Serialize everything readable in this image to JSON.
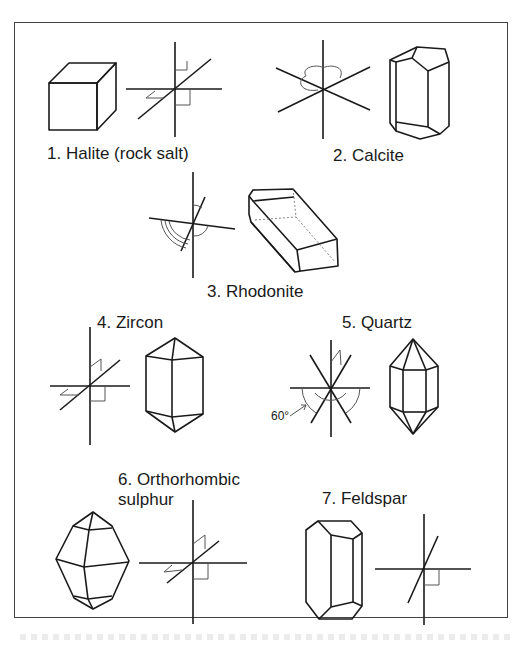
{
  "figure": {
    "minerals": [
      {
        "number": 1,
        "label": "1. Halite (rock salt)",
        "crystal_shape": "cube",
        "axes": "isometric-cubic"
      },
      {
        "number": 2,
        "label": "2. Calcite",
        "crystal_shape": "hexagonal-prism-rhombohedral",
        "axes": "trigonal"
      },
      {
        "number": 3,
        "label": "3. Rhodonite",
        "crystal_shape": "tabular-triclinic",
        "axes": "triclinic"
      },
      {
        "number": 4,
        "label": "4. Zircon",
        "crystal_shape": "tetragonal-bipyramid-prism",
        "axes": "tetragonal"
      },
      {
        "number": 5,
        "label": "5. Quartz",
        "crystal_shape": "hexagonal-prism-bipyramid",
        "axes": "hexagonal",
        "angle_label": "60°"
      },
      {
        "number": 6,
        "label_line1": "6. Orthorhombic",
        "label_line2": "sulphur",
        "crystal_shape": "orthorhombic-bipyramid",
        "axes": "orthorhombic"
      },
      {
        "number": 7,
        "label": "7. Feldspar",
        "crystal_shape": "monoclinic-prism",
        "axes": "monoclinic"
      }
    ]
  },
  "colors": {
    "line": "#1a1a1a",
    "thin": "#555555",
    "frame": "#444444",
    "background": "#ffffff"
  }
}
